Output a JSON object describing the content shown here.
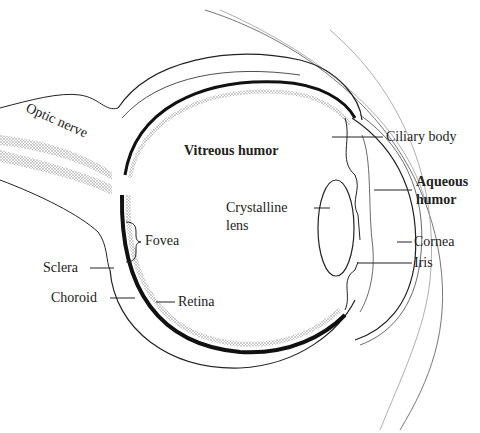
{
  "diagram": {
    "labels": {
      "optic_nerve": "Optic nerve",
      "vitreous_humor": "Vitreous humor",
      "ciliary_body": "Ciliary body",
      "aqueous_humor_1": "Aqueous",
      "aqueous_humor_2": "humor",
      "crystalline_lens_1": "Crystalline",
      "crystalline_lens_2": "lens",
      "cornea": "Cornea",
      "iris": "Iris",
      "fovea": "Fovea",
      "sclera": "Sclera",
      "choroid": "Choroid",
      "retina": "Retina"
    }
  }
}
